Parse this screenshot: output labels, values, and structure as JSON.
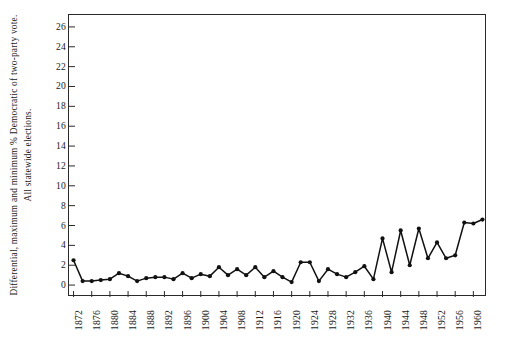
{
  "chart_data": {
    "type": "line",
    "title": "",
    "subtitle": "",
    "xlabel": "",
    "ylabel": "Differential, maximum and minimum % Democratic of two-party vote. All statewide elections.",
    "xlim": [
      1871,
      1963
    ],
    "ylim": [
      -1.2,
      27.2
    ],
    "grid": false,
    "legend": null,
    "marker": "filled-circle",
    "line_color": "#111111",
    "xticks": [
      1872,
      1876,
      1880,
      1884,
      1888,
      1892,
      1896,
      1900,
      1904,
      1908,
      1912,
      1916,
      1920,
      1924,
      1928,
      1932,
      1936,
      1940,
      1944,
      1948,
      1952,
      1956,
      1960
    ],
    "yticks": [
      0,
      2,
      4,
      6,
      8,
      10,
      12,
      14,
      16,
      18,
      20,
      22,
      24,
      26
    ],
    "ytick_labels": [
      "0",
      "2",
      "4",
      "6",
      "8",
      "10",
      "12",
      "14",
      "16",
      "18",
      "20",
      "22",
      "24",
      "26"
    ],
    "xtick_labels": [
      "1872",
      "1876",
      "1880",
      "1884",
      "1888",
      "1892",
      "1896",
      "1900",
      "1904",
      "1908",
      "1912",
      "1916",
      "1920",
      "1924",
      "1928",
      "1932",
      "1936",
      "1940",
      "1944",
      "1948",
      "1952",
      "1956",
      "1960"
    ],
    "x": [
      1872,
      1874,
      1876,
      1878,
      1880,
      1882,
      1884,
      1886,
      1888,
      1890,
      1892,
      1894,
      1896,
      1898,
      1900,
      1902,
      1904,
      1906,
      1908,
      1910,
      1912,
      1914,
      1916,
      1918,
      1920,
      1922,
      1924,
      1926,
      1928,
      1930,
      1932,
      1934,
      1936,
      1938,
      1940,
      1942,
      1944,
      1946,
      1948,
      1950,
      1952,
      1954,
      1956,
      1958,
      1960,
      1962
    ],
    "values": [
      2.5,
      0.4,
      0.4,
      0.5,
      0.6,
      1.2,
      0.9,
      0.4,
      0.7,
      0.8,
      0.8,
      0.6,
      1.2,
      0.7,
      1.1,
      0.9,
      1.8,
      1.0,
      1.6,
      1.0,
      1.8,
      0.8,
      1.4,
      0.8,
      0.3,
      2.3,
      2.3,
      0.4,
      1.6,
      1.1,
      0.8,
      1.3,
      1.9,
      0.6,
      4.7,
      1.3,
      5.5,
      2.0,
      5.7,
      2.7,
      4.3,
      2.7,
      3.0,
      6.3,
      6.2,
      6.6
    ],
    "series_note": "biennial values of the differential"
  },
  "axis": {
    "y_label_text": "Differential, maximum and minimum % Democratic of two-party vote. All statewide elections."
  }
}
